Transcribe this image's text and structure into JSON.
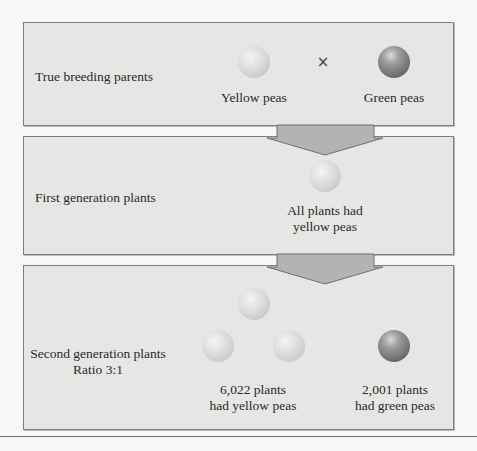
{
  "diagram": {
    "stages": [
      {
        "label": "True breeding parents",
        "peas": [
          {
            "color": "yellow",
            "caption": "Yellow peas"
          },
          {
            "color": "green",
            "caption": "Green peas"
          }
        ],
        "cross_symbol": "×"
      },
      {
        "label": "First generation plants",
        "peas": [
          {
            "color": "yellow"
          }
        ],
        "caption_line1": "All plants had",
        "caption_line2": "yellow peas"
      },
      {
        "label_line1": "Second generation plants",
        "label_line2": "Ratio 3:1",
        "yellow_caption_line1": "6,022 plants",
        "yellow_caption_line2": "had yellow peas",
        "green_caption_line1": "2,001 plants",
        "green_caption_line2": "had green peas",
        "yellow_count": 6022,
        "green_count": 2001,
        "ratio": "3:1"
      }
    ],
    "colors": {
      "box_fill": "#e6e6e4",
      "box_border": "#7e7e7e",
      "arrow_fill": "#b3b3b1",
      "background": "#f7f7f5"
    }
  }
}
